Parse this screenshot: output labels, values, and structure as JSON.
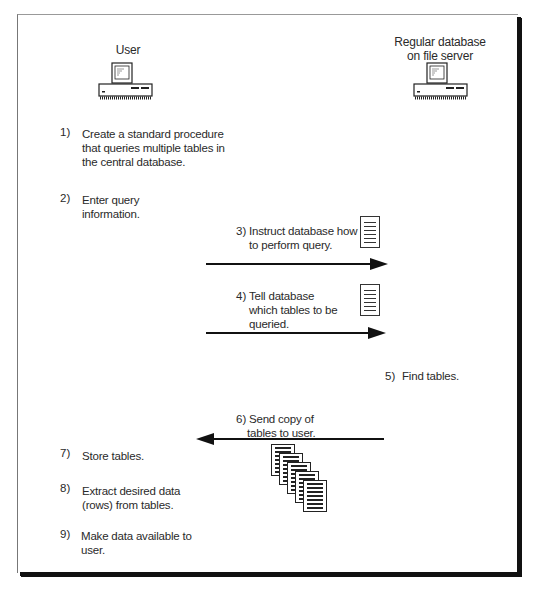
{
  "actors": {
    "user": {
      "label": "User",
      "icon": "desktop-computer-icon"
    },
    "server": {
      "label_line1": "Regular database",
      "label_line2": "on file server",
      "icon": "desktop-computer-icon"
    }
  },
  "steps": [
    {
      "num": "1)",
      "lines": [
        "Create a standard procedure",
        "that queries multiple tables in",
        "the central database."
      ]
    },
    {
      "num": "2)",
      "lines": [
        "Enter query",
        "information."
      ]
    },
    {
      "num": "3)",
      "lines": [
        "Instruct database how",
        "to perform query."
      ],
      "icon": "document-icon",
      "arrow": "right"
    },
    {
      "num": "4)",
      "lines": [
        "Tell database",
        "which tables to be",
        "queried."
      ],
      "icon": "document-icon",
      "arrow": "right"
    },
    {
      "num": "5)",
      "lines": [
        "Find tables."
      ]
    },
    {
      "num": "6)",
      "lines": [
        "Send copy of",
        "tables to user."
      ],
      "icon": "stacked-tables-icon",
      "arrow": "left"
    },
    {
      "num": "7)",
      "lines": [
        "Store tables."
      ]
    },
    {
      "num": "8)",
      "lines": [
        "Extract desired data",
        "(rows) from tables."
      ]
    },
    {
      "num": "9)",
      "lines": [
        "Make data available to",
        "user."
      ]
    }
  ],
  "caption": {
    "text": ""
  }
}
